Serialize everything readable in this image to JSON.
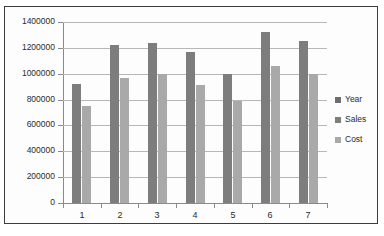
{
  "chart_data": {
    "type": "bar",
    "title": "",
    "xlabel": "",
    "ylabel": "",
    "categories": [
      "1",
      "2",
      "3",
      "4",
      "5",
      "6",
      "7"
    ],
    "ylim": [
      0,
      1400000
    ],
    "y_ticks": [
      "0",
      "200000",
      "400000",
      "600000",
      "800000",
      "1000000",
      "1200000",
      "1400000"
    ],
    "y_tick_values": [
      0,
      200000,
      400000,
      600000,
      800000,
      1000000,
      1200000,
      1400000
    ],
    "grid": true,
    "legend_position": "right",
    "series": [
      {
        "name": "Year",
        "color": "#6e6e6e",
        "values": [
          null,
          null,
          null,
          null,
          null,
          null,
          null
        ]
      },
      {
        "name": "Sales",
        "color": "#7d7d7d",
        "values": [
          920000,
          1220000,
          1240000,
          1170000,
          1000000,
          1320000,
          1250000
        ]
      },
      {
        "name": "Cost",
        "color": "#a9a9a9",
        "values": [
          750000,
          970000,
          1000000,
          910000,
          790000,
          1060000,
          1000000
        ]
      }
    ]
  },
  "legend": {
    "items": [
      {
        "label": "Year",
        "color": "#6e6e6e"
      },
      {
        "label": "Sales",
        "color": "#7d7d7d"
      },
      {
        "label": "Cost",
        "color": "#a9a9a9"
      }
    ]
  }
}
